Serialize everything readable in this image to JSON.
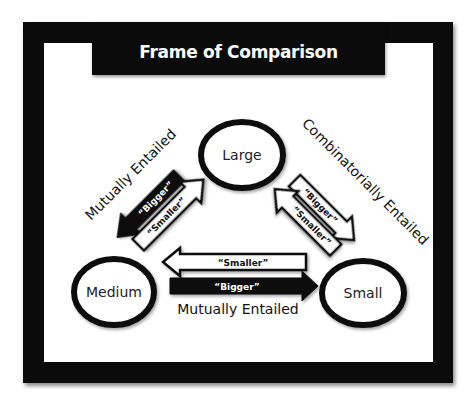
{
  "title": "Frame of Comparison",
  "nodes": {
    "large": {
      "label": "Large"
    },
    "medium": {
      "label": "Medium"
    },
    "small": {
      "label": "Small"
    }
  },
  "relations": {
    "left": {
      "label": "Mutually Entailed",
      "arrows": [
        {
          "label": "“Bigger”",
          "direction": "large-to-medium",
          "style": "filled-black"
        },
        {
          "label": "“Smaller”",
          "direction": "medium-to-large",
          "style": "outline-white"
        }
      ]
    },
    "right": {
      "label": "Combinatorially Entailed",
      "arrows": [
        {
          "label": "“Bigger”",
          "direction": "large-to-small",
          "style": "outline-white"
        },
        {
          "label": "“Smaller”",
          "direction": "small-to-large",
          "style": "outline-white"
        }
      ]
    },
    "bottom": {
      "label": "Mutually Entailed",
      "arrows": [
        {
          "label": "“Smaller”",
          "direction": "small-to-medium",
          "style": "outline-white"
        },
        {
          "label": "“Bigger”",
          "direction": "medium-to-small",
          "style": "filled-black"
        }
      ]
    }
  },
  "colors": {
    "frame": "#0b0b0b",
    "background": "#ffffff",
    "stroke": "#111111"
  }
}
